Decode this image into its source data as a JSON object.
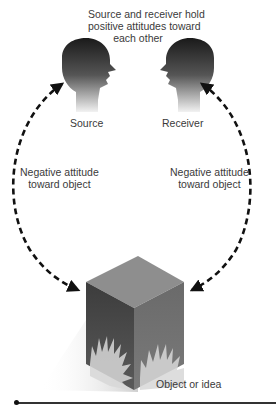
{
  "diagram": {
    "top_caption": [
      "Source and receiver hold",
      "positive attitudes toward",
      "each other"
    ],
    "source_label": "Source",
    "receiver_label": "Receiver",
    "left_arrow_label": [
      "Negative attitude",
      "toward object"
    ],
    "right_arrow_label": [
      "Negative attitude",
      "toward object"
    ],
    "object_label": "Object or idea",
    "colors": {
      "head_dark": "#1e1e1e",
      "arrow": "#111111",
      "box_top": "#8c8c8c",
      "box_left": "#4a4a4a",
      "box_right": "#6e6e6e",
      "text": "#3a3a3a"
    }
  }
}
